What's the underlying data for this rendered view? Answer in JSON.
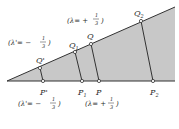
{
  "diagram": {
    "colors": {
      "fill": "#c8c8c8",
      "stroke": "#333333",
      "background": "#ffffff"
    },
    "points": {
      "apex": [
        7,
        81
      ],
      "Q_prime": {
        "label": "Q'",
        "xy": [
          40,
          68
        ]
      },
      "P_prime": {
        "label": "P'",
        "xy": [
          43,
          81
        ]
      },
      "Q1": {
        "label": "Q",
        "sub": "1",
        "xy": [
          75,
          52
        ]
      },
      "P1": {
        "label": "P",
        "sub": "1",
        "xy": [
          82,
          81
        ]
      },
      "Q": {
        "label": "Q",
        "xy": [
          91,
          44
        ]
      },
      "P": {
        "label": "P",
        "xy": [
          99,
          81
        ]
      },
      "Q2": {
        "label": "Q",
        "sub": "2",
        "xy": [
          141,
          21
        ]
      },
      "P2": {
        "label": "P",
        "sub": "2",
        "xy": [
          153,
          81
        ]
      }
    },
    "annotations": {
      "upper_left": {
        "open": "(λ'= −",
        "num": "1",
        "den": "3",
        "close": ")"
      },
      "upper_mid": {
        "open": "(λ= +",
        "num": "1",
        "den": "3",
        "close": ")"
      },
      "lower_left": {
        "open": "(λ'= −",
        "num": "1",
        "den": "3",
        "close": ")"
      },
      "lower_mid": {
        "open": "(λ= +",
        "num": "1",
        "den": "3",
        "close": ")"
      }
    }
  }
}
